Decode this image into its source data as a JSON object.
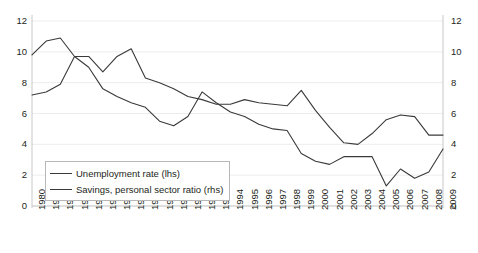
{
  "chart_data": {
    "type": "line",
    "title": "",
    "xlabel": "",
    "ylabel": "",
    "y_left_label": "",
    "y_right_label": "",
    "ylim": [
      0,
      12
    ],
    "y_right_lim": [
      0,
      12
    ],
    "yticks": [
      0,
      2,
      4,
      6,
      8,
      10,
      12
    ],
    "yticks_right": [
      0,
      2,
      4,
      6,
      8,
      10,
      12
    ],
    "grid": true,
    "legend_position": "lower-left-inside",
    "x": [
      1980,
      1981,
      1982,
      1983,
      1984,
      1985,
      1986,
      1987,
      1988,
      1989,
      1990,
      1991,
      1992,
      1993,
      1994,
      1995,
      1996,
      1997,
      1998,
      1999,
      2000,
      2001,
      2002,
      2003,
      2004,
      2005,
      2006,
      2007,
      2008,
      2009
    ],
    "categories": [
      "1980",
      "1981",
      "1982",
      "1983",
      "1984",
      "1985",
      "1986",
      "1987",
      "1988",
      "1989",
      "1990",
      "1991",
      "1992",
      "1993",
      "1994",
      "1995",
      "1996",
      "1997",
      "1998",
      "1999",
      "2000",
      "2001",
      "2002",
      "2003",
      "2004",
      "2005",
      "2006",
      "2007",
      "2008",
      "2009"
    ],
    "series": [
      {
        "name": "Unemployment rate (lhs)",
        "axis": "left",
        "color": "#3a3a3a",
        "values": [
          7.2,
          7.4,
          7.9,
          9.7,
          9.7,
          8.7,
          9.7,
          10.2,
          8.3,
          8.0,
          7.6,
          7.1,
          6.9,
          6.6,
          6.6,
          6.9,
          6.7,
          6.6,
          6.5,
          7.5,
          6.2,
          5.1,
          4.1,
          4.0,
          4.7,
          5.6,
          5.9,
          5.8,
          4.6,
          4.6
        ]
      },
      {
        "name": "Savings, personal sector ratio (rhs)",
        "axis": "right",
        "color": "#3a3a3a",
        "values": [
          9.8,
          10.7,
          10.9,
          9.7,
          9.0,
          7.6,
          7.1,
          6.7,
          6.4,
          5.5,
          5.2,
          5.8,
          7.4,
          6.7,
          6.1,
          5.8,
          5.3,
          5.0,
          4.9,
          3.4,
          2.9,
          2.7,
          3.2,
          3.2,
          3.2,
          1.3,
          2.4,
          1.8,
          2.2,
          3.7
        ]
      }
    ]
  },
  "legend": {
    "items": [
      {
        "label": "Unemployment rate (lhs)"
      },
      {
        "label": "Savings, personal sector ratio (rhs)"
      }
    ]
  },
  "colors": {
    "line": "#3a3a3a",
    "axis": "#c8c8c8",
    "grid": "#ededed",
    "text": "#231f20",
    "background": "#ffffff"
  }
}
